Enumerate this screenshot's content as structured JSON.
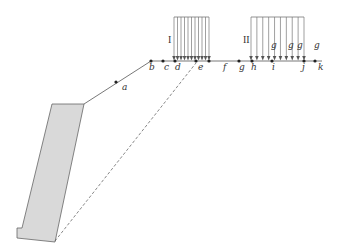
{
  "diagram": {
    "type": "structural-load-schematic",
    "colors": {
      "line": "#555555",
      "wall_fill": "#d9d9d9",
      "wall_stroke": "#666666",
      "arrow": "#666666"
    },
    "points": [
      {
        "id": "a",
        "label": "a"
      },
      {
        "id": "b",
        "label": "b"
      },
      {
        "id": "c",
        "label": "c"
      },
      {
        "id": "d",
        "label": "d"
      },
      {
        "id": "e",
        "label": "e"
      },
      {
        "id": "f",
        "label": "f"
      },
      {
        "id": "g",
        "label": "g"
      },
      {
        "id": "h",
        "label": "h"
      },
      {
        "id": "i",
        "label": "i"
      },
      {
        "id": "j",
        "label": "j"
      },
      {
        "id": "k",
        "label": "k"
      }
    ],
    "loads": [
      {
        "id": "I",
        "label": "I",
        "arrow_count": 11
      },
      {
        "id": "II",
        "label": "II",
        "arrow_count": 10
      }
    ],
    "g_labels": [
      "g",
      "g",
      "g",
      "g"
    ]
  }
}
